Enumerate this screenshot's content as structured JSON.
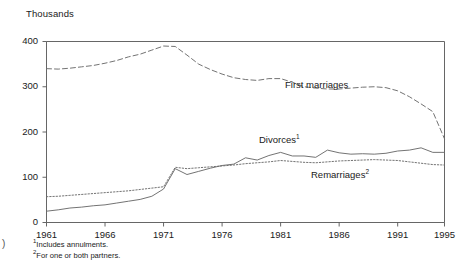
{
  "axis_unit_label": "Thousands",
  "edge_mark": ")",
  "y_ticks": [
    "0",
    "100",
    "200",
    "300",
    "400"
  ],
  "x_ticks": [
    "1961",
    "1966",
    "1971",
    "1976",
    "1981",
    "1986",
    "1991",
    "1995"
  ],
  "series_labels": {
    "first_marriages": "First marriages",
    "divorces": "Divorces",
    "divorces_note": "1",
    "remarriages": "Remarriages",
    "remarriages_note": "2"
  },
  "footnotes": [
    {
      "marker": "1",
      "text": "Includes annulments."
    },
    {
      "marker": "2",
      "text": "For one or both partners."
    }
  ],
  "colors": {
    "line": "#6b6b6b",
    "axis": "#555555",
    "text": "#1a1a1a",
    "background": "#ffffff"
  },
  "chart_data": {
    "type": "line",
    "title": "",
    "subtitle": "",
    "xlabel": "",
    "ylabel": "Thousands",
    "xlim": [
      1961,
      1995
    ],
    "ylim": [
      0,
      400
    ],
    "grid": false,
    "legend": "inline-annotations",
    "x": [
      1961,
      1962,
      1963,
      1964,
      1965,
      1966,
      1967,
      1968,
      1969,
      1970,
      1971,
      1972,
      1973,
      1974,
      1975,
      1976,
      1977,
      1978,
      1979,
      1980,
      1981,
      1982,
      1983,
      1984,
      1985,
      1986,
      1987,
      1988,
      1989,
      1990,
      1991,
      1992,
      1993,
      1994,
      1995
    ],
    "series": [
      {
        "name": "First marriages",
        "style": "dashed",
        "values": [
          340,
          339,
          341,
          344,
          347,
          352,
          358,
          366,
          372,
          381,
          390,
          389,
          370,
          350,
          338,
          328,
          320,
          316,
          314,
          318,
          318,
          310,
          300,
          297,
          295,
          295,
          297,
          299,
          300,
          298,
          291,
          278,
          262,
          245,
          185
        ]
      },
      {
        "name": "Divorces",
        "style": "solid",
        "note": "1",
        "values": [
          25,
          28,
          32,
          34,
          37,
          39,
          43,
          47,
          51,
          58,
          74,
          119,
          106,
          113,
          120,
          126,
          129,
          143,
          138,
          148,
          155,
          147,
          147,
          144,
          160,
          154,
          151,
          152,
          151,
          153,
          158,
          160,
          165,
          155,
          155
        ]
      },
      {
        "name": "Remarriages",
        "style": "dotted",
        "note": "2",
        "values": [
          57,
          58,
          60,
          62,
          64,
          66,
          68,
          70,
          73,
          76,
          79,
          122,
          119,
          121,
          123,
          125,
          127,
          130,
          132,
          134,
          137,
          135,
          133,
          132,
          134,
          136,
          137,
          138,
          139,
          138,
          137,
          134,
          131,
          128,
          127
        ]
      }
    ]
  }
}
